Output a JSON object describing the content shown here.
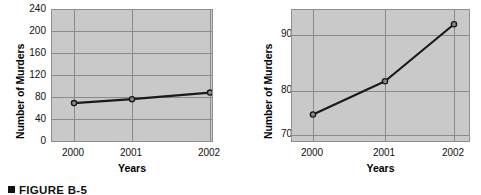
{
  "caption": {
    "bullet": "square-bullet",
    "text": "FIGURE B-5"
  },
  "charts": [
    {
      "id": "left",
      "ylabel": "Number of Murders",
      "xlabel": "Years",
      "yticks": [
        "0",
        "40",
        "80",
        "120",
        "160",
        "200",
        "240"
      ],
      "xticks": [
        "2000",
        "2001",
        "2002"
      ]
    },
    {
      "id": "right",
      "ylabel": "Number of Murders",
      "xlabel": "Years",
      "yticks": [
        "70",
        "80",
        "90"
      ],
      "xticks": [
        "2000",
        "2001",
        "2002"
      ]
    }
  ],
  "chart_data": [
    {
      "type": "line",
      "id": "murders-full-scale",
      "title": "",
      "xlabel": "Years",
      "ylabel": "Number of Murders",
      "categories": [
        "2000",
        "2001",
        "2002"
      ],
      "x": [
        2000,
        2001,
        2002
      ],
      "values": [
        72,
        79,
        91
      ],
      "series": [
        {
          "name": "Number of Murders",
          "values": [
            72,
            79,
            91
          ]
        }
      ],
      "ylim": [
        0,
        240
      ],
      "yticks": [
        0,
        40,
        80,
        120,
        160,
        200,
        240
      ],
      "xticks": [
        2000,
        2001,
        2002
      ],
      "grid": true,
      "legend": "none",
      "marker": "circle",
      "line_color": "#1a1a1a",
      "plot_background": "#c9c9c9",
      "note": "Full-scale y-axis starting at zero; trend appears nearly flat."
    },
    {
      "type": "line",
      "id": "murders-truncated-scale",
      "title": "",
      "xlabel": "Years",
      "ylabel": "Number of Murders",
      "categories": [
        "2000",
        "2001",
        "2002"
      ],
      "x": [
        2000,
        2001,
        2002
      ],
      "values": [
        72,
        79,
        91
      ],
      "series": [
        {
          "name": "Number of Murders",
          "values": [
            72,
            79,
            91
          ]
        }
      ],
      "ylim": [
        66,
        94
      ],
      "yticks": [
        70,
        80,
        90
      ],
      "xticks": [
        2000,
        2001,
        2002
      ],
      "grid": true,
      "legend": "none",
      "marker": "circle",
      "line_color": "#1a1a1a",
      "plot_background": "#c9c9c9",
      "note": "Truncated y-axis starting near 66; same data appears to rise steeply."
    }
  ],
  "colors": {
    "plot_background": "#c9c9c9",
    "gridline": "#8a8a8a",
    "axis_border": "#8f8f8f",
    "line": "#1a1a1a",
    "text": "#111111",
    "page_background": "#ffffff"
  }
}
